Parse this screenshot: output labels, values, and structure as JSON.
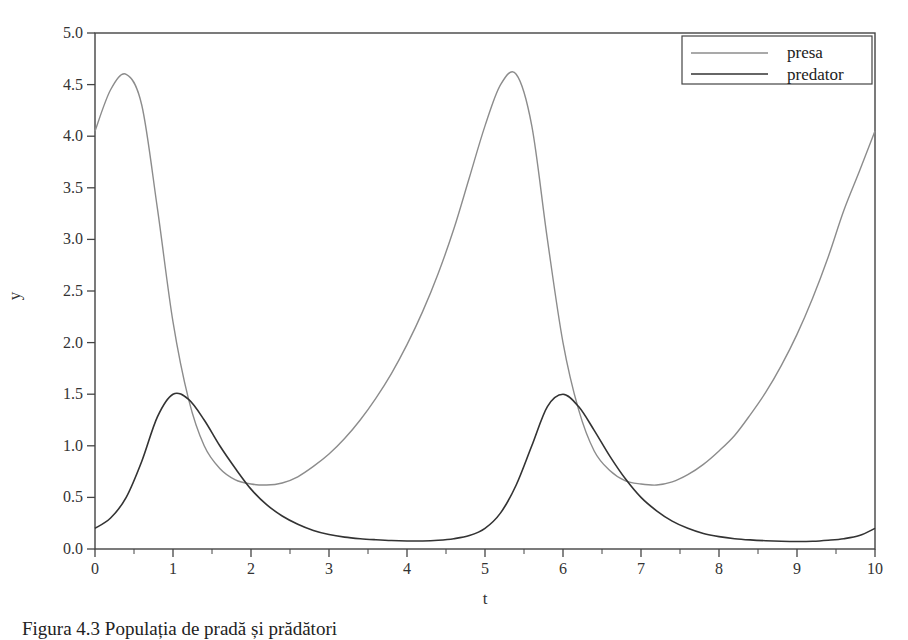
{
  "chart_data": {
    "type": "line",
    "title": "",
    "xlabel": "t",
    "ylabel": "y",
    "xlim": [
      0,
      10
    ],
    "ylim": [
      0,
      5
    ],
    "grid": false,
    "legend_position": "upper right",
    "x_ticks": [
      "0",
      "1",
      "2",
      "3",
      "4",
      "5",
      "6",
      "7",
      "8",
      "9",
      "10"
    ],
    "y_ticks": [
      "0.0",
      "0.5",
      "1.0",
      "1.5",
      "2.0",
      "2.5",
      "3.0",
      "3.5",
      "4.0",
      "4.5",
      "5.0"
    ],
    "x": [
      0,
      0.2,
      0.4,
      0.6,
      0.8,
      1.0,
      1.2,
      1.4,
      1.6,
      1.8,
      2.0,
      2.2,
      2.4,
      2.6,
      2.8,
      3.0,
      3.2,
      3.4,
      3.6,
      3.8,
      4.0,
      4.2,
      4.4,
      4.6,
      4.8,
      5.0,
      5.2,
      5.4,
      5.6,
      5.8,
      6.0,
      6.2,
      6.4,
      6.6,
      6.8,
      7.0,
      7.2,
      7.4,
      7.6,
      7.8,
      8.0,
      8.2,
      8.4,
      8.6,
      8.8,
      9.0,
      9.2,
      9.4,
      9.6,
      9.8,
      10.0
    ],
    "series": [
      {
        "name": "presa",
        "color": "#8c8c8c",
        "values": [
          4.05,
          4.45,
          4.6,
          4.3,
          3.3,
          2.2,
          1.45,
          1.0,
          0.78,
          0.67,
          0.63,
          0.62,
          0.64,
          0.7,
          0.8,
          0.92,
          1.07,
          1.25,
          1.46,
          1.7,
          1.98,
          2.3,
          2.67,
          3.1,
          3.6,
          4.1,
          4.5,
          4.6,
          4.1,
          3.0,
          2.0,
          1.35,
          0.95,
          0.76,
          0.66,
          0.63,
          0.62,
          0.65,
          0.72,
          0.82,
          0.95,
          1.1,
          1.3,
          1.52,
          1.78,
          2.08,
          2.43,
          2.83,
          3.28,
          3.66,
          4.05
        ]
      },
      {
        "name": "predator",
        "color": "#333333",
        "values": [
          0.2,
          0.3,
          0.5,
          0.85,
          1.28,
          1.5,
          1.45,
          1.25,
          1.0,
          0.78,
          0.58,
          0.43,
          0.32,
          0.24,
          0.18,
          0.14,
          0.115,
          0.1,
          0.09,
          0.082,
          0.078,
          0.078,
          0.085,
          0.1,
          0.13,
          0.2,
          0.35,
          0.62,
          1.0,
          1.38,
          1.5,
          1.38,
          1.15,
          0.9,
          0.68,
          0.5,
          0.37,
          0.27,
          0.2,
          0.15,
          0.12,
          0.1,
          0.088,
          0.08,
          0.075,
          0.073,
          0.075,
          0.085,
          0.1,
          0.13,
          0.2
        ]
      }
    ]
  },
  "figure": {
    "caption": "Figura 4.3 Populația de pradă și prădători"
  }
}
